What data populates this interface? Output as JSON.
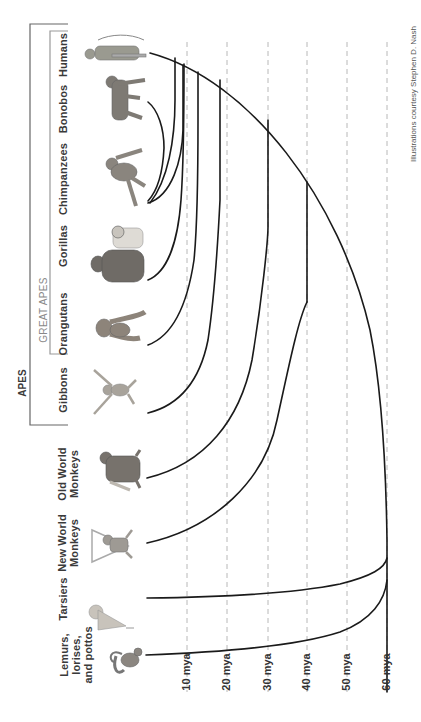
{
  "groups": {
    "apes": "APES",
    "great_apes": "GREAT APES"
  },
  "taxa": [
    {
      "name": "Humans",
      "line1": "Humans",
      "line2": "",
      "line3": "",
      "icon": "human-figure",
      "y": 55,
      "diverge_mya": 6
    },
    {
      "name": "Bonobos",
      "line1": "Bonobos",
      "line2": "",
      "line3": "",
      "icon": "bonobo-figure",
      "y": 100,
      "diverge_mya": 2
    },
    {
      "name": "Chimpanzees",
      "line1": "Chimpanzees",
      "line2": "",
      "line3": "",
      "icon": "chimpanzee-figure",
      "y": 172,
      "diverge_mya": 6
    },
    {
      "name": "Gorillas",
      "line1": "Gorillas",
      "line2": "",
      "line3": "",
      "icon": "gorilla-figure",
      "y": 240,
      "diverge_mya": 8
    },
    {
      "name": "Orangutans",
      "line1": "Orangutans",
      "line2": "",
      "line3": "",
      "icon": "orangutan-figure",
      "y": 322,
      "diverge_mya": 14
    },
    {
      "name": "Gibbons",
      "line1": "Gibbons",
      "line2": "",
      "line3": "",
      "icon": "gibbon-figure",
      "y": 384,
      "diverge_mya": 18
    },
    {
      "name": "Old World Monkeys",
      "line1": "Old World",
      "line2": "Monkeys",
      "line3": "",
      "icon": "old-world-monkey-figure",
      "y": 470,
      "diverge_mya": 30
    },
    {
      "name": "New World Monkeys",
      "line1": "New World",
      "line2": "Monkeys",
      "line3": "",
      "icon": "new-world-monkey-figure",
      "y": 545,
      "diverge_mya": 40
    },
    {
      "name": "Tarsiers",
      "line1": "Tarsiers",
      "line2": "",
      "line3": "",
      "icon": "tarsier-figure",
      "y": 628,
      "diverge_mya": 58
    },
    {
      "name": "Lemurs, lorises, and pottos",
      "line1": "Lemurs,",
      "line2": "lorises,",
      "line3": "and pottos",
      "icon": "lemur-figure",
      "y": 685,
      "diverge_mya": 60
    }
  ],
  "time_axis": {
    "ticks": [
      "10 mya",
      "20 mya",
      "30 mya",
      "40 mya",
      "50 mya",
      "60 mya"
    ],
    "x_positions": [
      186,
      227,
      268,
      307,
      347,
      387
    ]
  },
  "credit": "Illustrations courtesy Stephen D. Nash",
  "colors": {
    "line": "#1a1a1a",
    "grid": "#b8b8b8",
    "bracket": "#555555",
    "text": "#3a3a3a"
  }
}
